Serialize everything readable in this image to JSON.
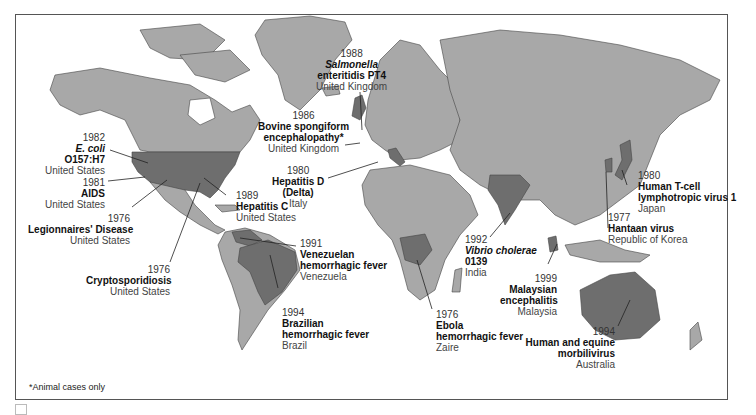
{
  "map": {
    "title": "Emerging infectious diseases by year and location of first identification",
    "colors": {
      "land": "#a8a8a8",
      "highlight": "#6e6e6e",
      "water": "#ffffff",
      "border": "#444444"
    },
    "footnote": "*Animal cases only",
    "labels": [
      {
        "id": "salmonella",
        "year": "1988",
        "name": "Salmonella enteritidis PT4",
        "name_line1": "Salmonella",
        "name_line2": "enteritidis PT4",
        "country": "United Kingdom"
      },
      {
        "id": "bse",
        "year": "1986",
        "name": "Bovine spongiform encephalopathy*",
        "name_line1": "Bovine spongiform",
        "name_line2": "encephalopathy*",
        "country": "United Kingdom"
      },
      {
        "id": "ecoli",
        "year": "1982",
        "name": "E. coli O157:H7",
        "name_line1": "E. coli",
        "name_line2": "O157:H7",
        "country": "United States"
      },
      {
        "id": "aids",
        "year": "1981",
        "name": "AIDS",
        "country": "United States"
      },
      {
        "id": "hepd",
        "year": "1980",
        "name": "Hepatitis D (Delta)",
        "name_line1": "Hepatitis D",
        "name_line2": "(Delta)",
        "country": "Italy"
      },
      {
        "id": "hepc",
        "year": "1989",
        "name": "Hepatitis C",
        "country": "United States"
      },
      {
        "id": "legion",
        "year": "1976",
        "name": "Legionnaires' Disease",
        "country": "United States"
      },
      {
        "id": "crypto",
        "year": "1976",
        "name": "Cryptosporidiosis",
        "country": "United States"
      },
      {
        "id": "venez",
        "year": "1991",
        "name": "Venezuelan hemorrhagic fever",
        "name_line1": "Venezuelan",
        "name_line2": "hemorrhagic fever",
        "country": "Venezuela"
      },
      {
        "id": "brazil",
        "year": "1994",
        "name": "Brazilian hemorrhagic fever",
        "name_line1": "Brazilian",
        "name_line2": "hemorrhagic fever",
        "country": "Brazil"
      },
      {
        "id": "ebola",
        "year": "1976",
        "name": "Ebola hemorrhagic fever",
        "name_line1": "Ebola",
        "name_line2": "hemorrhagic fever",
        "country": "Zaire"
      },
      {
        "id": "vibrio",
        "year": "1992",
        "name": "Vibrio cholerae 0139",
        "name_line1": "Vibrio cholerae",
        "name_line2": "0139",
        "country": "India"
      },
      {
        "id": "malay",
        "year": "1999",
        "name": "Malaysian encephalitis",
        "name_line1": "Malaysian",
        "name_line2": "encephalitis",
        "country": "Malaysia"
      },
      {
        "id": "htlv",
        "year": "1980",
        "name": "Human T-cell lymphotropic virus 1",
        "name_line1": "Human T-cell",
        "name_line2": "lymphotropic virus 1",
        "country": "Japan"
      },
      {
        "id": "hantaan",
        "year": "1977",
        "name": "Hantaan virus",
        "country": "Republic of Korea"
      },
      {
        "id": "morbili",
        "year": "1994",
        "name": "Human and equine morbilivirus",
        "name_line1": "Human and equine",
        "name_line2": "morbilivirus",
        "country": "Australia"
      }
    ]
  }
}
